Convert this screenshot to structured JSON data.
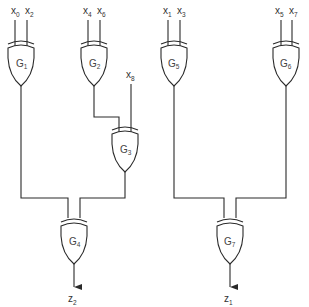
{
  "diagram": {
    "type": "logic-circuit",
    "gate_type": "XOR",
    "inputs": [
      {
        "id": "x0",
        "base": "x",
        "sub": "0"
      },
      {
        "id": "x2",
        "base": "x",
        "sub": "2"
      },
      {
        "id": "x4",
        "base": "x",
        "sub": "4"
      },
      {
        "id": "x6",
        "base": "x",
        "sub": "6"
      },
      {
        "id": "x8",
        "base": "x",
        "sub": "8"
      },
      {
        "id": "x1",
        "base": "x",
        "sub": "1"
      },
      {
        "id": "x3",
        "base": "x",
        "sub": "3"
      },
      {
        "id": "x5",
        "base": "x",
        "sub": "5"
      },
      {
        "id": "x7",
        "base": "x",
        "sub": "7"
      }
    ],
    "gates": [
      {
        "id": "G1",
        "base": "G",
        "sub": "1",
        "inputs": [
          "x0",
          "x2"
        ]
      },
      {
        "id": "G2",
        "base": "G",
        "sub": "2",
        "inputs": [
          "x4",
          "x6"
        ]
      },
      {
        "id": "G3",
        "base": "G",
        "sub": "3",
        "inputs": [
          "G2",
          "x8"
        ]
      },
      {
        "id": "G4",
        "base": "G",
        "sub": "4",
        "inputs": [
          "G1",
          "G3"
        ]
      },
      {
        "id": "G5",
        "base": "G",
        "sub": "5",
        "inputs": [
          "x1",
          "x3"
        ]
      },
      {
        "id": "G6",
        "base": "G",
        "sub": "6",
        "inputs": [
          "x5",
          "x7"
        ]
      },
      {
        "id": "G7",
        "base": "G",
        "sub": "7",
        "inputs": [
          "G5",
          "G6"
        ]
      }
    ],
    "outputs": [
      {
        "id": "z2",
        "base": "z",
        "sub": "2",
        "from": "G4"
      },
      {
        "id": "z1",
        "base": "z",
        "sub": "1",
        "from": "G7"
      }
    ]
  }
}
